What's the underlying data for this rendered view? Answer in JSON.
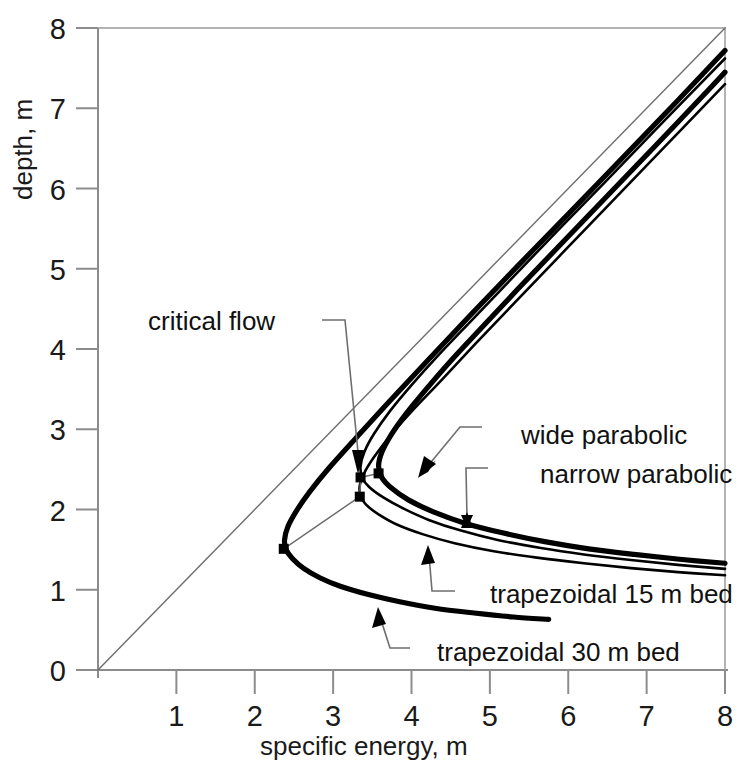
{
  "chart_data": {
    "type": "line",
    "title": "",
    "xlabel": "specific energy, m",
    "ylabel": "depth, m",
    "xlim": [
      0,
      8
    ],
    "ylim": [
      0,
      8
    ],
    "xticks": [
      "0",
      "1",
      "2",
      "3",
      "4",
      "5",
      "6",
      "7",
      "8"
    ],
    "yticks": [
      "0",
      "1",
      "2",
      "3",
      "4",
      "5",
      "6",
      "7",
      "8"
    ],
    "grid": false,
    "legend_position": "inline-annotations",
    "annotations": [
      "critical flow",
      "wide parabolic",
      "narrow parabolic",
      "trapezoidal 15 m bed",
      "trapezoidal 30 m bed"
    ],
    "series": [
      {
        "name": "critical flow line (E = y)",
        "style": "thin",
        "points": [
          [
            0,
            0
          ],
          [
            8,
            8
          ]
        ]
      },
      {
        "name": "trapezoidal 30 m bed",
        "style": "thick",
        "critical_point": [
          2.37,
          1.51
        ],
        "points": [
          [
            5.75,
            0.63
          ],
          [
            5.3,
            0.66
          ],
          [
            4.8,
            0.71
          ],
          [
            4.3,
            0.77
          ],
          [
            3.85,
            0.85
          ],
          [
            3.45,
            0.94
          ],
          [
            3.1,
            1.04
          ],
          [
            2.83,
            1.15
          ],
          [
            2.62,
            1.27
          ],
          [
            2.48,
            1.39
          ],
          [
            2.4,
            1.5
          ],
          [
            2.38,
            1.62
          ],
          [
            2.42,
            1.78
          ],
          [
            2.53,
            1.98
          ],
          [
            2.7,
            2.22
          ],
          [
            2.95,
            2.52
          ],
          [
            3.3,
            2.9
          ],
          [
            3.72,
            3.35
          ],
          [
            4.2,
            3.85
          ],
          [
            4.75,
            4.42
          ],
          [
            5.35,
            5.03
          ],
          [
            6.0,
            5.68
          ],
          [
            6.7,
            6.39
          ],
          [
            7.4,
            7.1
          ],
          [
            8.0,
            7.72
          ]
        ]
      },
      {
        "name": "trapezoidal 15 m bed",
        "style": "thin",
        "critical_point": [
          3.34,
          2.16
        ],
        "points": [
          [
            8.0,
            1.18
          ],
          [
            7.4,
            1.22
          ],
          [
            6.8,
            1.27
          ],
          [
            6.2,
            1.33
          ],
          [
            5.6,
            1.4
          ],
          [
            5.05,
            1.48
          ],
          [
            4.55,
            1.58
          ],
          [
            4.15,
            1.69
          ],
          [
            3.82,
            1.81
          ],
          [
            3.58,
            1.94
          ],
          [
            3.42,
            2.06
          ],
          [
            3.35,
            2.17
          ],
          [
            3.34,
            2.3
          ],
          [
            3.4,
            2.46
          ],
          [
            3.52,
            2.65
          ],
          [
            3.72,
            2.91
          ],
          [
            4.0,
            3.22
          ],
          [
            4.38,
            3.61
          ],
          [
            4.82,
            4.07
          ],
          [
            5.32,
            4.58
          ],
          [
            5.9,
            5.17
          ],
          [
            6.52,
            5.8
          ],
          [
            7.22,
            6.51
          ],
          [
            8.0,
            7.3
          ]
        ]
      },
      {
        "name": "narrow parabolic",
        "style": "thin",
        "critical_point": [
          3.35,
          2.4
        ],
        "points": [
          [
            8.0,
            1.26
          ],
          [
            7.4,
            1.31
          ],
          [
            6.8,
            1.37
          ],
          [
            6.2,
            1.44
          ],
          [
            5.65,
            1.52
          ],
          [
            5.1,
            1.62
          ],
          [
            4.62,
            1.74
          ],
          [
            4.22,
            1.87
          ],
          [
            3.9,
            2.01
          ],
          [
            3.64,
            2.15
          ],
          [
            3.46,
            2.28
          ],
          [
            3.37,
            2.4
          ],
          [
            3.35,
            2.54
          ],
          [
            3.4,
            2.72
          ],
          [
            3.52,
            2.94
          ],
          [
            3.72,
            3.22
          ],
          [
            4.0,
            3.55
          ],
          [
            4.35,
            3.93
          ],
          [
            4.78,
            4.37
          ],
          [
            5.28,
            4.88
          ],
          [
            5.84,
            5.45
          ],
          [
            6.46,
            6.07
          ],
          [
            7.18,
            6.8
          ],
          [
            8.0,
            7.62
          ]
        ]
      },
      {
        "name": "wide parabolic",
        "style": "thick",
        "critical_point": [
          3.58,
          2.45
        ],
        "points": [
          [
            8.0,
            1.33
          ],
          [
            7.42,
            1.38
          ],
          [
            6.84,
            1.44
          ],
          [
            6.26,
            1.51
          ],
          [
            5.7,
            1.6
          ],
          [
            5.16,
            1.71
          ],
          [
            4.68,
            1.83
          ],
          [
            4.28,
            1.97
          ],
          [
            3.96,
            2.12
          ],
          [
            3.74,
            2.27
          ],
          [
            3.62,
            2.4
          ],
          [
            3.58,
            2.54
          ],
          [
            3.62,
            2.71
          ],
          [
            3.74,
            2.93
          ],
          [
            3.92,
            3.18
          ],
          [
            4.18,
            3.49
          ],
          [
            4.5,
            3.85
          ],
          [
            4.9,
            4.27
          ],
          [
            5.36,
            4.75
          ],
          [
            5.88,
            5.28
          ],
          [
            6.46,
            5.87
          ],
          [
            7.1,
            6.52
          ],
          [
            7.8,
            7.24
          ],
          [
            8.0,
            7.45
          ]
        ]
      }
    ],
    "critical_points": [
      {
        "label": "trapezoidal 30 m bed",
        "x": 2.37,
        "y": 1.51
      },
      {
        "label": "trapezoidal 15 m bed",
        "x": 3.34,
        "y": 2.16
      },
      {
        "label": "narrow parabolic",
        "x": 3.35,
        "y": 2.4
      },
      {
        "label": "wide parabolic",
        "x": 3.58,
        "y": 2.45
      }
    ]
  },
  "axes": {
    "x_title": "specific energy, m",
    "y_title": "depth, m",
    "x_tick_labels": [
      "0",
      "1",
      "2",
      "3",
      "4",
      "5",
      "6",
      "7",
      "8"
    ],
    "y_tick_labels": [
      "0",
      "1",
      "2",
      "3",
      "4",
      "5",
      "6",
      "7",
      "8"
    ]
  },
  "labels": {
    "critical_flow": "critical flow",
    "wide_parabolic": "wide parabolic",
    "narrow_parabolic": "narrow parabolic",
    "trapezoidal_15": "trapezoidal 15 m bed",
    "trapezoidal_30": "trapezoidal 30 m bed"
  },
  "colors": {
    "axis": "#8c8c8c",
    "curve": "#000000",
    "text": "#111111",
    "background": "#ffffff",
    "leader": "#6e6e6e"
  }
}
